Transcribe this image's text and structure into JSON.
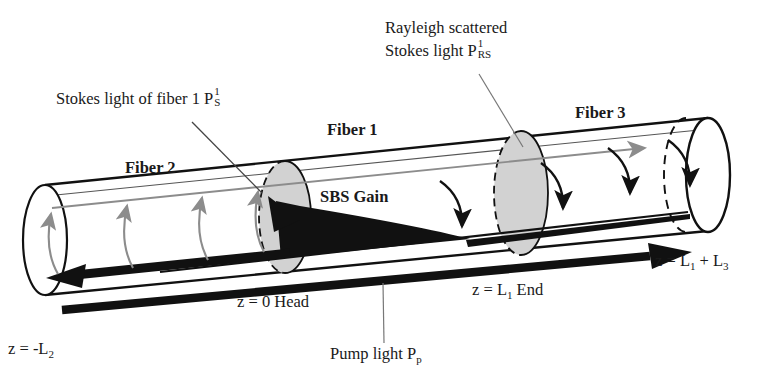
{
  "figure": {
    "type": "optical-fiber-sbs-schematic"
  },
  "labels": {
    "stokes_fiber1": {
      "text": "Stokes light of fiber 1 P",
      "sup": "1",
      "subscript": "S"
    },
    "rayleigh": {
      "line1": "Rayleigh scattered",
      "line2": "Stokes light P",
      "sup": "1",
      "subscript": "RS"
    },
    "fiber1": "Fiber 1",
    "fiber2": "Fiber 2",
    "fiber3": "Fiber 3",
    "sbs_gain": "SBS Gain",
    "z_head": "z = 0 Head",
    "z_end": "z = L",
    "z_end_sub": "1",
    "z_end_tail": " End",
    "z_left": "z = -L",
    "z_left_sub": "2",
    "z_right": "z = L",
    "z_right_sub1": "1",
    "z_right_mid": " + L",
    "z_right_sub2": "3",
    "pump": "Pump light P",
    "pump_sub": "p"
  },
  "colors": {
    "ink": "#1a1a1a",
    "outline": "#111111",
    "ellipse_fill": "#d2d2d2",
    "gray_arrow": "#8c8c8c",
    "background": "#ffffff"
  },
  "elements": {
    "cylinder_left_cap": "left-end-cap-ellipse",
    "cylinder_right_cap": "right-end-cap-ellipse",
    "junction_head": "cross-section-at-z-0",
    "junction_end": "cross-section-at-z-L1",
    "pump_arrow": "thick-black-arrow-rightward",
    "stokes_arrow": "thick-black-arrow-leftward",
    "sbs_wedge": "tapered-black-wedge-stokes-growth",
    "rayleigh_arrow": "thin-gray-arrow-rightward"
  }
}
